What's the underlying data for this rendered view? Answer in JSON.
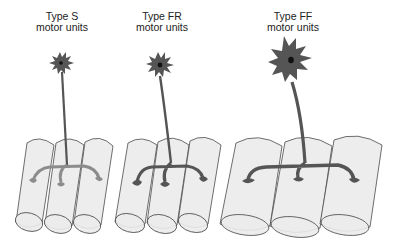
{
  "colors": {
    "background": "#ffffff",
    "fiber_fill": "#ebebeb",
    "fiber_stroke": "#4a4a4a",
    "neuron_S": "#555555",
    "neuron_S_terminals": "#8c8c8c",
    "neuron_FR": "#555555",
    "neuron_FF": "#555555",
    "nucleus": "#111111",
    "label_text": "#222222"
  },
  "motor_units": [
    {
      "id": "S",
      "title": "Type S",
      "subtitle": "motor units"
    },
    {
      "id": "FR",
      "title": "Type FR",
      "subtitle": "motor units"
    },
    {
      "id": "FF",
      "title": "Type FF",
      "subtitle": "motor units"
    }
  ]
}
